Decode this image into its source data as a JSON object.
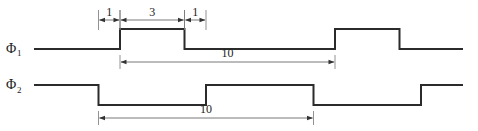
{
  "diagram": {
    "units": "time units",
    "signals": [
      {
        "id": "phi1",
        "symbol": "Φ",
        "subscript": "1",
        "initial_level": "low",
        "edges": [
          {
            "t": 0,
            "to": "high"
          },
          {
            "t": 3,
            "to": "low"
          },
          {
            "t": 10,
            "to": "high"
          },
          {
            "t": 13,
            "to": "low"
          }
        ],
        "t_start": -4,
        "t_end": 16
      },
      {
        "id": "phi2",
        "symbol": "Φ",
        "subscript": "2",
        "initial_level": "high",
        "edges": [
          {
            "t": -1,
            "to": "low"
          },
          {
            "t": 4,
            "to": "high"
          },
          {
            "t": 9,
            "to": "low"
          },
          {
            "t": 14,
            "to": "high"
          }
        ],
        "t_start": -4,
        "t_end": 16
      }
    ],
    "dimensions": [
      {
        "id": "gap-before",
        "from": -1,
        "to": 0,
        "label": "1",
        "row": "top"
      },
      {
        "id": "phi1-high",
        "from": 0,
        "to": 3,
        "label": "3",
        "row": "top"
      },
      {
        "id": "gap-after",
        "from": 3,
        "to": 4,
        "label": "1",
        "row": "top"
      },
      {
        "id": "phi1-period",
        "from": 0,
        "to": 10,
        "label": "10",
        "row": "phi1"
      },
      {
        "id": "phi2-period",
        "from": -1,
        "to": 9,
        "label": "10",
        "row": "phi2"
      }
    ]
  }
}
